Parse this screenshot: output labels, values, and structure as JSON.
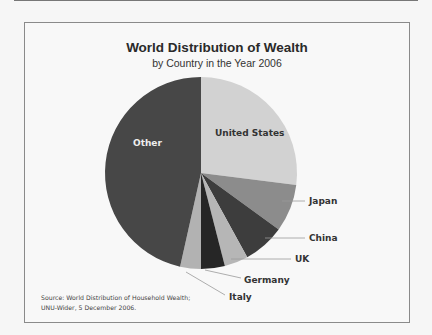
{
  "chart_data": {
    "type": "pie",
    "title": "World Distribution of Wealth",
    "subtitle": "by Country in the Year 2006",
    "categories": [
      "United States",
      "Japan",
      "China",
      "UK",
      "Germany",
      "Italy",
      "Other"
    ],
    "values": [
      27,
      8,
      7,
      4,
      4,
      3.5,
      46.5
    ],
    "unit": "percent (estimated from slice angles)",
    "start_angle_deg": 0,
    "direction": "clockwise",
    "colors": [
      "#d2d2d2",
      "#8c8c8c",
      "#3d3d3d",
      "#b6b6b6",
      "#262626",
      "#b2b2b2",
      "#474747"
    ],
    "label_positions": [
      "inside",
      "outside",
      "outside",
      "outside",
      "outside",
      "outside",
      "inside"
    ],
    "legend": "none",
    "source": "Source: World Distribution of Household Wealth; UNU-Wider, 5 December 2006."
  },
  "header": {
    "title": "World Distribution of Wealth",
    "subtitle": "by Country in the Year 2006"
  },
  "labels": {
    "us": "United States",
    "japan": "Japan",
    "china": "China",
    "uk": "UK",
    "germany": "Germany",
    "italy": "Italy",
    "other": "Other"
  },
  "source": {
    "line1": "Source: World Distribution of Household Wealth;",
    "line2": "UNU-Wider, 5 December 2006."
  }
}
